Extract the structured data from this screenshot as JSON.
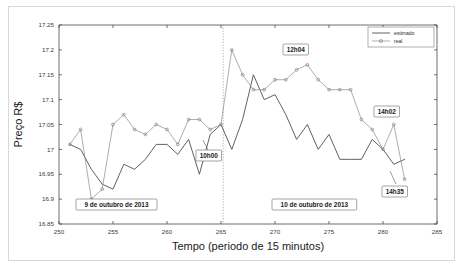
{
  "chart_data": {
    "type": "line",
    "title": "",
    "xlabel": "Tempo (periodo de 15 minutos)",
    "ylabel": "Preço R$",
    "xlim": [
      250,
      285
    ],
    "ylim": [
      16.85,
      17.25
    ],
    "xticks": [
      250,
      255,
      260,
      265,
      270,
      275,
      280,
      285
    ],
    "xtick_labels": [
      "250",
      "255",
      "260",
      "265",
      "270",
      "275",
      "280",
      "285"
    ],
    "yticks": [
      16.85,
      16.9,
      16.95,
      17.0,
      17.05,
      17.1,
      17.15,
      17.2,
      17.25
    ],
    "ytick_labels": [
      "16.85",
      "16.9",
      "16.95",
      "17",
      "17.05",
      "17.1",
      "17.15",
      "17.2",
      "17.25"
    ],
    "grid": false,
    "legend_position": "top-right",
    "x": [
      251,
      252,
      253,
      254,
      255,
      256,
      257,
      258,
      259,
      260,
      261,
      262,
      263,
      264,
      265,
      266,
      267,
      268,
      269,
      270,
      271,
      272,
      273,
      274,
      275,
      276,
      277,
      278,
      279,
      280,
      281,
      282
    ],
    "series": [
      {
        "name": "estimado",
        "marker": "none",
        "color": "#4f4f4f",
        "values": [
          17.01,
          17.0,
          16.96,
          16.93,
          16.92,
          16.97,
          16.96,
          16.98,
          17.01,
          17.01,
          16.99,
          17.02,
          16.95,
          17.03,
          17.05,
          17.0,
          17.06,
          17.15,
          17.1,
          17.11,
          17.07,
          17.02,
          17.05,
          17.0,
          17.03,
          16.98,
          16.98,
          16.98,
          17.02,
          17.0,
          16.97,
          16.98
        ]
      },
      {
        "name": "real",
        "marker": "circle",
        "color": "#8a8a8a",
        "values": [
          17.01,
          17.04,
          16.9,
          16.92,
          17.05,
          17.07,
          17.04,
          17.03,
          17.05,
          17.04,
          17.01,
          17.06,
          17.06,
          17.04,
          17.05,
          17.2,
          17.15,
          17.12,
          17.12,
          17.14,
          17.14,
          17.16,
          17.17,
          17.14,
          17.12,
          17.12,
          17.12,
          17.06,
          17.04,
          17.0,
          17.05,
          16.94
        ]
      }
    ],
    "annotations": [
      {
        "label": "10h00",
        "x": 266,
        "y": 16.99,
        "note": "divider marker on day boundary"
      },
      {
        "label": "12h04",
        "x": 272.3,
        "y": 17.19,
        "note": "peak of real series"
      },
      {
        "label": "14h02",
        "x": 281,
        "y": 17.09,
        "note": "late spike"
      },
      {
        "label": "14h35",
        "x": 282,
        "y": 16.9,
        "note": "final point"
      },
      {
        "label": "9 de outubro de 2013",
        "x": 256.5,
        "y": 16.875,
        "note": "day 1 region"
      },
      {
        "label": "10 de outubro de 2013",
        "x": 273.5,
        "y": 16.875,
        "note": "day 2 region"
      }
    ],
    "divider": {
      "x": 265.2,
      "style": "dotted",
      "note": "separates the two trading days"
    }
  },
  "legend": {
    "entries": [
      {
        "label": "estimado"
      },
      {
        "label": "real"
      }
    ]
  },
  "icons": {
    "circle_marker": "circle-marker-icon"
  }
}
